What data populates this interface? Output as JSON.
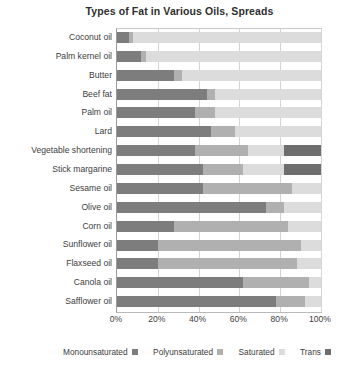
{
  "chart_data": {
    "type": "bar",
    "orientation": "horizontal",
    "stacked": true,
    "title": "Types of Fat in Various Oils, Spreads",
    "xlabel": "",
    "ylabel": "",
    "xlim": [
      0,
      100
    ],
    "xtick_labels": [
      "0%",
      "20%",
      "40%",
      "60%",
      "80%",
      "100%"
    ],
    "xtick_values": [
      0,
      20,
      40,
      60,
      80,
      100
    ],
    "grid": true,
    "legend_position": "bottom",
    "categories": [
      "Coconut oil",
      "Palm kernel oil",
      "Butter",
      "Beef fat",
      "Palm oil",
      "Lard",
      "Vegetable shortening",
      "Stick margarine",
      "Sesame oil",
      "Olive oil",
      "Corn oil",
      "Sunflower oil",
      "Flaxseed oil",
      "Canola oil",
      "Safflower oil"
    ],
    "series": [
      {
        "name": "Monounsaturated",
        "color": "#7d7d7d",
        "values": [
          6,
          12,
          28,
          44,
          38,
          46,
          38,
          42,
          42,
          73,
          28,
          20,
          20,
          62,
          78
        ]
      },
      {
        "name": "Polyunsaturated",
        "color": "#b0b0b0",
        "values": [
          2,
          2,
          4,
          4,
          10,
          12,
          26,
          20,
          44,
          9,
          56,
          70,
          68,
          32,
          14
        ]
      },
      {
        "name": "Saturated",
        "color": "#dcdcdc",
        "values": [
          92,
          86,
          68,
          52,
          52,
          42,
          18,
          20,
          14,
          18,
          16,
          10,
          12,
          6,
          8
        ]
      },
      {
        "name": "Trans",
        "color": "#6e6e6e",
        "values": [
          0,
          0,
          0,
          0,
          0,
          0,
          18,
          18,
          0,
          0,
          0,
          0,
          0,
          0,
          0
        ]
      }
    ]
  },
  "legend": {
    "items": [
      {
        "label": "Monounsaturated",
        "color": "#7d7d7d"
      },
      {
        "label": "Polyunsaturated",
        "color": "#b0b0b0"
      },
      {
        "label": "Saturated",
        "color": "#dcdcdc"
      },
      {
        "label": "Trans",
        "color": "#6e6e6e"
      }
    ]
  }
}
